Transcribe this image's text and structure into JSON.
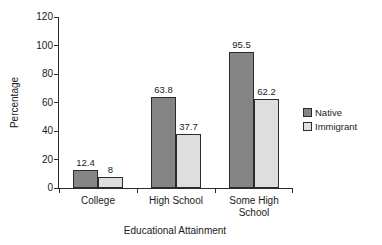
{
  "chart_data": {
    "type": "bar",
    "title": "",
    "xlabel": "Educational Attainment",
    "ylabel": "Percentage",
    "categories": [
      "College",
      "High School",
      "Some High School"
    ],
    "series": [
      {
        "name": "Native",
        "color": "#858585",
        "values": [
          12.4,
          63.8,
          95.5
        ]
      },
      {
        "name": "Immigrant",
        "color": "#dedede",
        "values": [
          8,
          37.7,
          62.2
        ]
      }
    ],
    "value_labels": [
      [
        "12.4",
        "8"
      ],
      [
        "63.8",
        "37.7"
      ],
      [
        "95.5",
        "62.2"
      ]
    ],
    "ylim": [
      0,
      120
    ],
    "yticks": [
      0,
      20,
      40,
      60,
      80,
      100,
      120
    ],
    "grid": false,
    "legend_position": "right",
    "axis_color": "#2b2b2b",
    "text_color": "#1a1a1a"
  }
}
